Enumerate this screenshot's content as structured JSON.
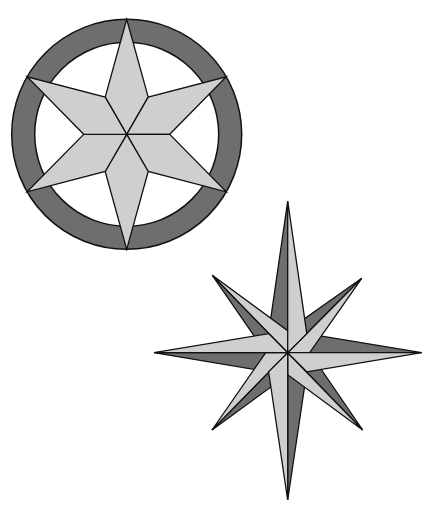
{
  "colors": {
    "background": "#ffffff",
    "dark": "#6e6e6e",
    "light": "#cfcfcf",
    "outline": "#111111",
    "ring_inner": "#ffffff"
  },
  "star_in_circle": {
    "label": "Six-pointed star in ring",
    "center": [
      126.7,
      134.3
    ],
    "ring_outer_radius": 115,
    "ring_inner_radius": 92,
    "tip_radius": 115,
    "inner_radius": 43,
    "points": 6
  },
  "compass_rose": {
    "label": "Eight-pointed compass rose",
    "center": [
      287.7,
      352.7
    ],
    "main_tips": {
      "N": [
        287.7,
        201
      ],
      "E": [
        421.7,
        352.7
      ],
      "S": [
        287.7,
        500
      ],
      "W": [
        154,
        352.7
      ]
    },
    "diagonal_tips": {
      "NE": [
        361.7,
        278.3
      ],
      "SE": [
        362.7,
        430
      ],
      "SW": [
        212,
        430
      ],
      "NW": [
        212.3,
        275.3
      ]
    },
    "main_side_radius": 27,
    "diagonal_side_radius": 22
  }
}
